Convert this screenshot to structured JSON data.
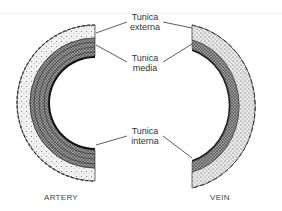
{
  "diagram": {
    "labels": {
      "externa": {
        "line1": "Tunica",
        "line2": "externa"
      },
      "media": {
        "line1": "Tunica",
        "line2": "media"
      },
      "interna": {
        "line1": "Tunica",
        "line2": "interna"
      }
    },
    "captions": {
      "artery": "ARTERY",
      "vein": "VEIN"
    },
    "colors": {
      "ink": "#1a1a1a",
      "stipple": "#777777",
      "background": "#ffffff"
    }
  }
}
